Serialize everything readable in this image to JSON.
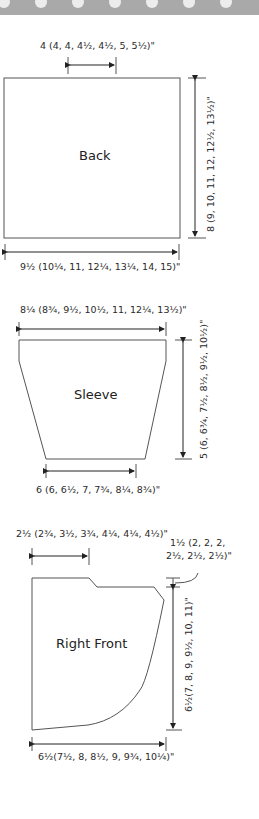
{
  "banner": {
    "color": "#a9a9a9",
    "dot_color": "#ececec",
    "dot_count": 7
  },
  "pieces": {
    "back": {
      "name": "Back",
      "top_label": "4 (4, 4, 4½, 4½, 5, 5½)\"",
      "side_label": "8 (9, 10, 11, 12, 12½, 13½)\"",
      "bottom_label": "9½ (10¼, 11, 12¼, 13¼, 14, 15)\""
    },
    "sleeve": {
      "name": "Sleeve",
      "top_label": "8¼ (8¾, 9½, 10½, 11, 12¼, 13½)\"",
      "side_label": "5 (6, 6¾, 7½, 8½, 9½, 10½)\"",
      "bottom_label": "6 (6, 6½, 7, 7¾, 8¼, 8¾)\""
    },
    "right_front": {
      "name": "Right Front",
      "top_label": "2½ (2¾, 3½, 3¾, 4¼, 4¼, 4½)\"",
      "shoulder_label_line1": "1½ (2, 2, 2,",
      "shoulder_label_line2": "2½, 2½, 2½)\"",
      "side_label": "6½(7, 8, 9, 9½, 10, 11)\"",
      "bottom_label": "6½(7½, 8, 8½, 9, 9¾, 10¼)\""
    }
  },
  "colors": {
    "line": "#555555",
    "text": "#2a2a2a"
  }
}
